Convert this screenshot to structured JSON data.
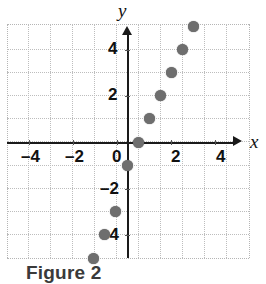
{
  "figure": {
    "caption": "Figure 2",
    "axis_labels": {
      "x": "x",
      "y": "y"
    },
    "dot_color": "#6e6e6e",
    "axis_color": "#1a1a1a",
    "grid_color": "#bdbdbd"
  },
  "chart_data": {
    "type": "scatter",
    "title": "",
    "xlabel": "x",
    "ylabel": "y",
    "xlim": [
      -5.4,
      5.4
    ],
    "ylim": [
      -6.1,
      5.0
    ],
    "grid": true,
    "legend": null,
    "xticks": [
      -4,
      -2,
      0,
      2,
      4
    ],
    "yticks": [
      4,
      2,
      -2,
      -4
    ],
    "xticklabels": [
      "-4",
      "-2",
      "0",
      "2",
      "4"
    ],
    "yticklabels": [
      "4",
      "2",
      "-2",
      "-4"
    ],
    "points": [
      {
        "x": -1.5,
        "y": -5
      },
      {
        "x": -1.0,
        "y": -4
      },
      {
        "x": -0.5,
        "y": -3
      },
      {
        "x": 0.0,
        "y": -1
      },
      {
        "x": 0.5,
        "y": 0
      },
      {
        "x": 1.0,
        "y": 1
      },
      {
        "x": 1.5,
        "y": 2
      },
      {
        "x": 2.0,
        "y": 3
      },
      {
        "x": 2.5,
        "y": 4
      },
      {
        "x": 3.0,
        "y": 5
      }
    ]
  },
  "ticklabels": {
    "x": [
      {
        "text": "-4",
        "px": 21,
        "py": 148
      },
      {
        "text": "-2",
        "px": 65,
        "py": 148
      },
      {
        "text": "0",
        "px": 112,
        "py": 148
      },
      {
        "text": "2",
        "px": 171,
        "py": 148
      },
      {
        "text": "4",
        "px": 216,
        "py": 148
      }
    ],
    "y": [
      {
        "text": "4",
        "px": 108,
        "py": 40
      },
      {
        "text": "2",
        "px": 108,
        "py": 86
      },
      {
        "text": "-2",
        "px": 100,
        "py": 180
      },
      {
        "text": "-4",
        "px": 100,
        "py": 226
      }
    ]
  }
}
